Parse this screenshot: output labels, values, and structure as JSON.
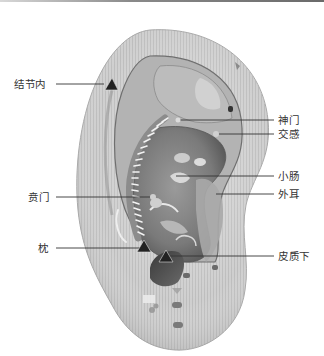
{
  "figure": {
    "colors": {
      "ear_skin": "#c8c8c8",
      "ear_shadow": "#8f8f8f",
      "concha_dark": "#5a5a5a",
      "leader_line": "#333333",
      "marker": "#222222",
      "text": "#333333"
    }
  },
  "labels": {
    "left": [
      {
        "text": "结节内",
        "marker": "triangle"
      },
      {
        "text": "贲门",
        "marker": "none"
      },
      {
        "text": "枕",
        "marker": "triangle"
      }
    ],
    "right": [
      {
        "text": "神门",
        "marker": "none"
      },
      {
        "text": "交感",
        "marker": "none"
      },
      {
        "text": "小肠",
        "marker": "none"
      },
      {
        "text": "外耳",
        "marker": "none"
      },
      {
        "text": "皮质下",
        "marker": "triangle"
      }
    ]
  }
}
